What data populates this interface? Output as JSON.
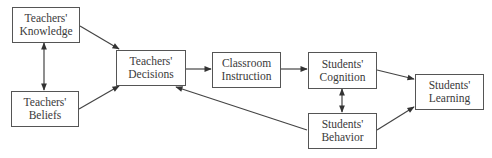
{
  "diagram": {
    "type": "flowchart",
    "nodes": {
      "teachers_knowledge": {
        "line1": "Teachers'",
        "line2": "Knowledge"
      },
      "teachers_beliefs": {
        "line1": "Teachers'",
        "line2": "Beliefs"
      },
      "teachers_decisions": {
        "line1": "Teachers'",
        "line2": "Decisions"
      },
      "classroom_instruction": {
        "line1": "Classroom",
        "line2": "Instruction"
      },
      "students_cognition": {
        "line1": "Students'",
        "line2": "Cognition"
      },
      "students_behavior": {
        "line1": "Students'",
        "line2": "Behavior"
      },
      "students_learning": {
        "line1": "Students'",
        "line2": "Learning"
      }
    },
    "edges": [
      {
        "from": "Teachers' Knowledge",
        "to": "Teachers' Beliefs",
        "bidirectional": true
      },
      {
        "from": "Teachers' Knowledge",
        "to": "Teachers' Decisions",
        "bidirectional": false
      },
      {
        "from": "Teachers' Beliefs",
        "to": "Teachers' Decisions",
        "bidirectional": false
      },
      {
        "from": "Teachers' Decisions",
        "to": "Classroom Instruction",
        "bidirectional": false
      },
      {
        "from": "Classroom Instruction",
        "to": "Students' Cognition",
        "bidirectional": false
      },
      {
        "from": "Students' Cognition",
        "to": "Students' Behavior",
        "bidirectional": true
      },
      {
        "from": "Students' Cognition",
        "to": "Students' Learning",
        "bidirectional": false
      },
      {
        "from": "Students' Behavior",
        "to": "Students' Learning",
        "bidirectional": false
      },
      {
        "from": "Students' Behavior",
        "to": "Teachers' Decisions",
        "bidirectional": false
      }
    ],
    "colors": {
      "line": "#444444",
      "box_border": "#555555",
      "text": "#3a3a3a",
      "background": "#ffffff"
    }
  }
}
